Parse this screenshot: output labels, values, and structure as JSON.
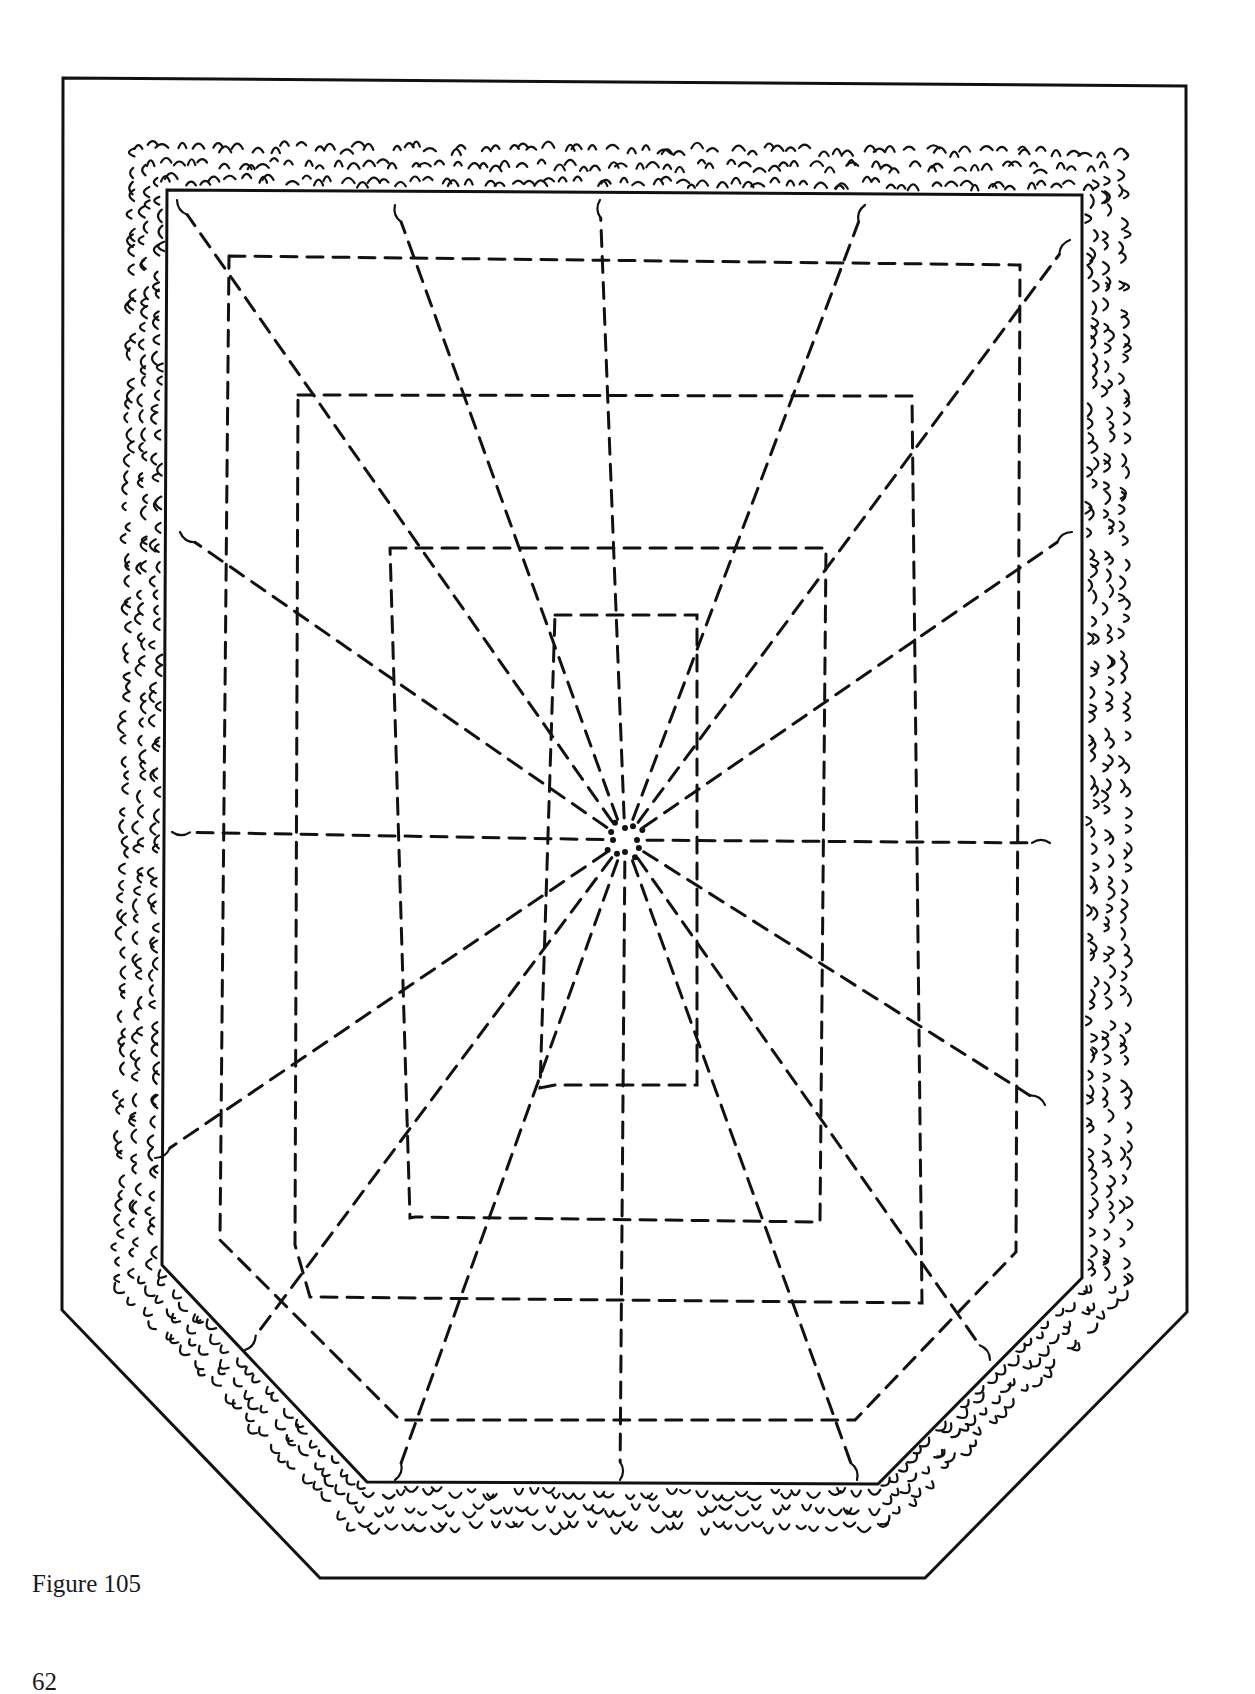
{
  "figure": {
    "caption": "Figure 105",
    "page_number": "62",
    "colors": {
      "ink": "#111111",
      "paper": "#ffffff"
    },
    "outer_boundary": [
      [
        63,
        78
      ],
      [
        1186,
        86
      ],
      [
        1187,
        1312
      ],
      [
        925,
        1578
      ],
      [
        320,
        1578
      ],
      [
        62,
        1310
      ]
    ],
    "hedge_band_outer": [
      [
        122,
        135
      ],
      [
        1135,
        140
      ],
      [
        1138,
        1300
      ],
      [
        885,
        1540
      ],
      [
        345,
        1540
      ],
      [
        105,
        1292
      ]
    ],
    "inner_bed": [
      [
        167,
        190
      ],
      [
        1082,
        195
      ],
      [
        1082,
        1278
      ],
      [
        878,
        1484
      ],
      [
        367,
        1482
      ],
      [
        162,
        1265
      ]
    ],
    "center": [
      625,
      840
    ],
    "dashed_outlines": [
      [
        [
          229,
          256
        ],
        [
          1020,
          265
        ],
        [
          1016,
          1252
        ],
        [
          855,
          1420
        ],
        [
          400,
          1420
        ],
        [
          220,
          1240
        ]
      ],
      [
        [
          298,
          395
        ],
        [
          912,
          396
        ],
        [
          922,
          1303
        ],
        [
          310,
          1297
        ],
        [
          295,
          1245
        ]
      ],
      [
        [
          390,
          548
        ],
        [
          826,
          548
        ],
        [
          820,
          1222
        ],
        [
          415,
          1217
        ],
        [
          410,
          1218
        ]
      ],
      [
        [
          555,
          615
        ],
        [
          697,
          615
        ],
        [
          697,
          1085
        ],
        [
          555,
          1085
        ],
        [
          540,
          1088
        ]
      ]
    ],
    "radial_endpoints": [
      [
        177,
        200
      ],
      [
        395,
        205
      ],
      [
        600,
        200
      ],
      [
        865,
        205
      ],
      [
        1070,
        240
      ],
      [
        1072,
        532
      ],
      [
        1050,
        843
      ],
      [
        1045,
        1105
      ],
      [
        990,
        1360
      ],
      [
        857,
        1480
      ],
      [
        620,
        1480
      ],
      [
        395,
        1480
      ],
      [
        245,
        1350
      ],
      [
        155,
        1158
      ],
      [
        172,
        832
      ],
      [
        180,
        532
      ]
    ]
  }
}
